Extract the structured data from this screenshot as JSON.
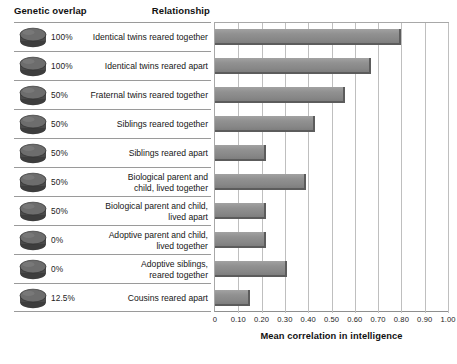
{
  "header": {
    "genetic_overlap": "Genetic overlap",
    "relationship": "Relationship"
  },
  "axis": {
    "title": "Mean correlation in intelligence",
    "tick_labels": [
      "0",
      "0.10",
      "0.20",
      "0.30",
      "0.40",
      "0.50",
      "0.60",
      "0.70",
      "0.80",
      "0.90",
      "1.00"
    ]
  },
  "colors": {
    "bar_fill": "#8f8f8f",
    "bar_edge": "#5c5c5c",
    "gridline": "#bfbfbf",
    "rule": "#9a9a9a",
    "disc_top": "#6f6f6f",
    "disc_side": "#3d3d3d"
  },
  "chart_data": {
    "type": "bar",
    "orientation": "horizontal",
    "title": "",
    "xlabel": "Mean correlation in intelligence",
    "ylabel": "",
    "xlim": [
      0,
      1.0
    ],
    "xticks": [
      0,
      0.1,
      0.2,
      0.3,
      0.4,
      0.5,
      0.6,
      0.7,
      0.8,
      0.9,
      1.0
    ],
    "grid": true,
    "legend": "none",
    "categories": [
      "Identical twins reared together",
      "Identical twins reared apart",
      "Fraternal twins reared together",
      "Siblings reared together",
      "Siblings reared apart",
      "Biological parent and child, lived together",
      "Biological parent and child, lived apart",
      "Adoptive parent and child, lived together",
      "Adoptive siblings, reared together",
      "Cousins reared apart"
    ],
    "values": [
      0.8,
      0.67,
      0.56,
      0.43,
      0.22,
      0.39,
      0.22,
      0.22,
      0.31,
      0.15
    ],
    "genetic_overlap": [
      "100%",
      "100%",
      "50%",
      "50%",
      "50%",
      "50%",
      "50%",
      "0%",
      "0%",
      "12.5%"
    ]
  },
  "rows": [
    {
      "genetic_overlap": "100%",
      "relationship_lines": [
        "Identical twins reared together"
      ],
      "value": 0.8,
      "disc_icon": "disc-icon"
    },
    {
      "genetic_overlap": "100%",
      "relationship_lines": [
        "Identical twins reared apart"
      ],
      "value": 0.67,
      "disc_icon": "disc-icon"
    },
    {
      "genetic_overlap": "50%",
      "relationship_lines": [
        "Fraternal twins reared together"
      ],
      "value": 0.56,
      "disc_icon": "disc-icon"
    },
    {
      "genetic_overlap": "50%",
      "relationship_lines": [
        "Siblings reared together"
      ],
      "value": 0.43,
      "disc_icon": "disc-icon"
    },
    {
      "genetic_overlap": "50%",
      "relationship_lines": [
        "Siblings reared apart"
      ],
      "value": 0.22,
      "disc_icon": "disc-icon"
    },
    {
      "genetic_overlap": "50%",
      "relationship_lines": [
        "Biological parent and",
        "child, lived together"
      ],
      "value": 0.39,
      "disc_icon": "disc-icon"
    },
    {
      "genetic_overlap": "50%",
      "relationship_lines": [
        "Biological parent and child,",
        "lived apart"
      ],
      "value": 0.22,
      "disc_icon": "disc-icon"
    },
    {
      "genetic_overlap": "0%",
      "relationship_lines": [
        "Adoptive parent and child,",
        "lived together"
      ],
      "value": 0.22,
      "disc_icon": "disc-icon"
    },
    {
      "genetic_overlap": "0%",
      "relationship_lines": [
        "Adoptive siblings,",
        "reared together"
      ],
      "value": 0.31,
      "disc_icon": "disc-icon"
    },
    {
      "genetic_overlap": "12.5%",
      "relationship_lines": [
        "Cousins reared apart"
      ],
      "value": 0.15,
      "disc_icon": "disc-icon"
    }
  ]
}
